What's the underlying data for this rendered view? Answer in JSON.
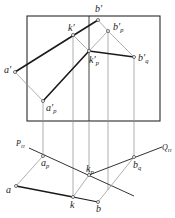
{
  "diagram": {
    "type": "descriptive-geometry-projection",
    "colors": {
      "bold_line": "#1a1a1a",
      "construction_line": "#9a9a9a",
      "frame": "#2a2a2a",
      "background": "#ffffff"
    },
    "frame": {
      "x": 27,
      "y": 16,
      "width": 133,
      "height": 105,
      "divider_x": 89
    },
    "labels": {
      "b_prime": {
        "base": "b",
        "mark": "′"
      },
      "k_prime": {
        "base": "k",
        "mark": "′"
      },
      "bp_prime": {
        "base": "b",
        "mark": "′",
        "sub": "p"
      },
      "kp_prime": {
        "base": "k",
        "mark": "′",
        "sub": "p"
      },
      "bq_prime": {
        "base": "b",
        "mark": "′",
        "sub": "q"
      },
      "a_prime": {
        "base": "a",
        "mark": "′"
      },
      "ap_prime": {
        "base": "a",
        "mark": "′",
        "sub": "p"
      },
      "PH": {
        "base": "P",
        "sub": "H"
      },
      "QH": {
        "base": "Q",
        "sub": "H"
      },
      "ap": {
        "base": "a",
        "sub": "p"
      },
      "kp": {
        "base": "k",
        "sub": "p"
      },
      "bq": {
        "base": "b",
        "sub": "q"
      },
      "a": {
        "base": "a"
      },
      "k": {
        "base": "k"
      },
      "b": {
        "base": "b"
      }
    },
    "points_front_view": [
      {
        "name": "b′",
        "x": 98,
        "y": 20
      },
      {
        "name": "k′",
        "x": 73,
        "y": 35
      },
      {
        "name": "b′p",
        "x": 108,
        "y": 31
      },
      {
        "name": "k′p",
        "x": 89,
        "y": 51
      },
      {
        "name": "b′q",
        "x": 134,
        "y": 57
      },
      {
        "name": "a′",
        "x": 15,
        "y": 72
      },
      {
        "name": "a′p",
        "x": 43,
        "y": 101
      }
    ],
    "points_top_view": [
      {
        "name": "ap",
        "x": 43,
        "y": 156
      },
      {
        "name": "kp",
        "x": 89,
        "y": 175
      },
      {
        "name": "bq",
        "x": 134,
        "y": 157
      },
      {
        "name": "a",
        "x": 16,
        "y": 186
      },
      {
        "name": "k",
        "x": 73,
        "y": 197
      },
      {
        "name": "b",
        "x": 98,
        "y": 202
      }
    ],
    "traces": [
      {
        "name": "PH",
        "from": [
          29,
          148
        ],
        "to": [
          134,
          196
        ]
      },
      {
        "name": "QH",
        "from": [
          89,
          175
        ],
        "to": [
          162,
          147
        ]
      }
    ]
  }
}
